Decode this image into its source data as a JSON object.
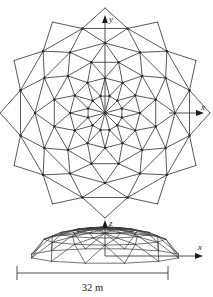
{
  "figure": {
    "stroke_color": "#3a3a3a",
    "text_color": "#1a1a1a",
    "background": "#ffffff"
  },
  "plan_view": {
    "name": "plan-view",
    "axis_y_label": "y",
    "axis_x_label": "x",
    "center": {
      "x": 105,
      "y": 113
    },
    "rings": 5,
    "sectors": 12,
    "ring_radii": [
      17.5,
      35,
      52.5,
      70,
      87.5
    ],
    "outer_radius": 87.5
  },
  "elevation_view": {
    "name": "elevation-view",
    "axis_z_label": "z",
    "axis_x_label": "x",
    "springing_y": 256,
    "apex_y": 228,
    "half_span": 76,
    "center_x": 105
  },
  "dimension": {
    "name": "span-dimension",
    "label": "32 m",
    "value": 32,
    "unit": "m",
    "line_y": 273,
    "x_start": 17,
    "x_end": 168
  }
}
